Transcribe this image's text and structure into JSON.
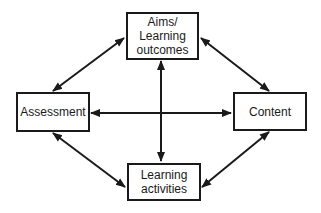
{
  "diagram": {
    "type": "concept-map",
    "nodes": {
      "aims": {
        "label": "Aims/\nLearning\noutcomes"
      },
      "assessment": {
        "label": "Assessment"
      },
      "content": {
        "label": "Content"
      },
      "activities": {
        "label": "Learning\nactivities"
      }
    },
    "edges": [
      {
        "from": "aims",
        "to": "assessment",
        "direction": "both"
      },
      {
        "from": "aims",
        "to": "content",
        "direction": "both"
      },
      {
        "from": "aims",
        "to": "activities",
        "direction": "both"
      },
      {
        "from": "assessment",
        "to": "content",
        "direction": "both"
      },
      {
        "from": "assessment",
        "to": "activities",
        "direction": "both"
      },
      {
        "from": "content",
        "to": "activities",
        "direction": "both"
      }
    ],
    "colors": {
      "stroke": "#1a1a1a",
      "background": "#ffffff"
    }
  }
}
